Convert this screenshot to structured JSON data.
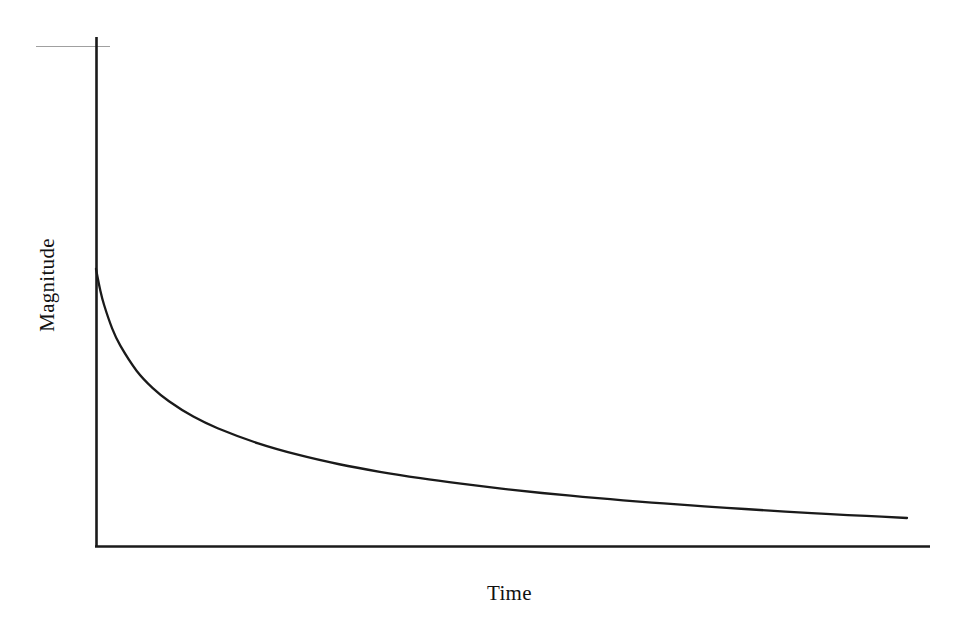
{
  "figure": {
    "background_color": "#ffffff",
    "line_color": "#1a1a1a",
    "artifact_color": "#a0a0a0",
    "y_axis_label": "Magnitude",
    "x_axis_label": "Time"
  },
  "chart_data": {
    "type": "line",
    "title": "",
    "subtitle": "",
    "xlabel": "Time",
    "ylabel": "Magnitude",
    "legend": [],
    "legend_position": "none",
    "grid": false,
    "x_tick_labels": [],
    "y_tick_labels": [],
    "xlim": [
      0,
      1
    ],
    "ylim": [
      0,
      1
    ],
    "annotations": [],
    "series": [
      {
        "name": "decay",
        "x": [
          0.0,
          0.005,
          0.01,
          0.02,
          0.03,
          0.05,
          0.07,
          0.09,
          0.12,
          0.15,
          0.2,
          0.25,
          0.3,
          0.35,
          0.4,
          0.45,
          0.5,
          0.55,
          0.6,
          0.65,
          0.7,
          0.75,
          0.8,
          0.85,
          0.9,
          0.95,
          1.0
        ],
        "y": [
          1.0,
          0.93,
          0.876,
          0.795,
          0.736,
          0.65,
          0.59,
          0.545,
          0.492,
          0.452,
          0.4,
          0.36,
          0.328,
          0.302,
          0.28,
          0.261,
          0.244,
          0.229,
          0.216,
          0.204,
          0.193,
          0.183,
          0.174,
          0.165,
          0.157,
          0.15,
          0.143
        ]
      }
    ]
  },
  "geometry": {
    "y_axis": {
      "x": 96,
      "y_top": 37,
      "y_bottom": 547
    },
    "x_axis": {
      "y": 547,
      "x_left": 96,
      "x_right": 930
    },
    "artifact_line": {
      "y": 46,
      "x_left": 36,
      "x_right": 110
    },
    "curve_start": {
      "x": 96,
      "y": 269
    },
    "curve_end": {
      "x": 907,
      "y": 518
    }
  }
}
